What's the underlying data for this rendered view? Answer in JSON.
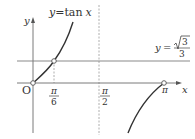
{
  "figure": {
    "curve_label": {
      "y": "y",
      "eq": "=",
      "fn": "tan",
      "x": "x"
    },
    "hline_label": {
      "y": "y",
      "eq": "=",
      "num": "3",
      "den": "3"
    },
    "axes": {
      "x_label": "x",
      "y_label": "y",
      "origin_label": "O"
    },
    "ticks": {
      "pi_over_6": {
        "num": "π",
        "den": "6"
      },
      "pi_over_2": {
        "num": "π",
        "den": "2"
      },
      "pi": "π"
    },
    "colors": {
      "axis": "#7a7a7a",
      "curve": "#333333",
      "dashed": "#9a9a9a",
      "text": "#333333"
    }
  }
}
